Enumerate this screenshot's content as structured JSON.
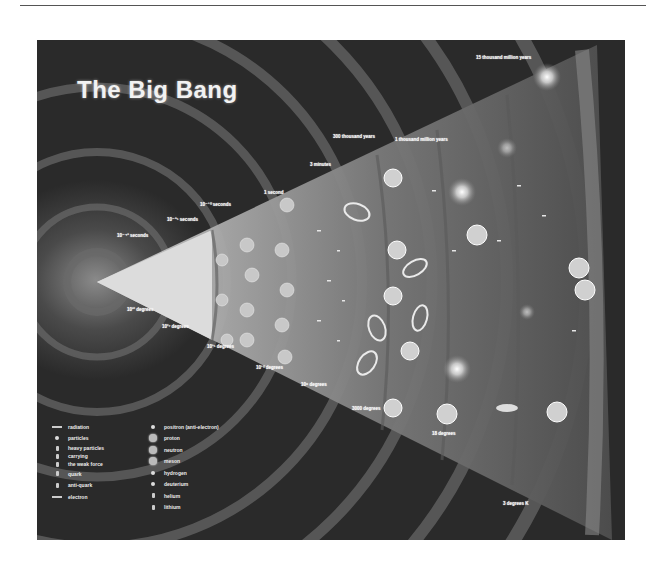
{
  "diagram": {
    "title": "The Big Bang",
    "time_labels": [
      {
        "text": "10⁻⁴³ seconds",
        "x": 80,
        "y": 193
      },
      {
        "text": "10⁻³⁵ seconds",
        "x": 130,
        "y": 177
      },
      {
        "text": "10⁻¹⁰ seconds",
        "x": 163,
        "y": 162
      },
      {
        "text": "1 second",
        "x": 227,
        "y": 150
      },
      {
        "text": "3 minutes",
        "x": 273,
        "y": 122
      },
      {
        "text": "300 thousand years",
        "x": 296,
        "y": 94
      },
      {
        "text": "1 thousand million years",
        "x": 358,
        "y": 97
      },
      {
        "text": "15 thousand million years",
        "x": 439,
        "y": 15
      }
    ],
    "temperature_labels": [
      {
        "text": "10³² degrees",
        "x": 90,
        "y": 267
      },
      {
        "text": "10²⁷ degrees",
        "x": 125,
        "y": 284
      },
      {
        "text": "10¹⁵ degrees",
        "x": 170,
        "y": 304
      },
      {
        "text": "10¹⁰ degrees",
        "x": 219,
        "y": 325
      },
      {
        "text": "10⁹ degrees",
        "x": 264,
        "y": 342
      },
      {
        "text": "3000 degrees",
        "x": 315,
        "y": 366
      },
      {
        "text": "18 degrees",
        "x": 395,
        "y": 391
      },
      {
        "text": "3 degrees K",
        "x": 466,
        "y": 461
      }
    ],
    "legend": {
      "left": [
        {
          "symbol": "line",
          "label": "radiation"
        },
        {
          "symbol": "dot",
          "label": "particles"
        },
        {
          "symbol": "small",
          "label": "heavy particles"
        },
        {
          "symbol": "small",
          "label": "carrying"
        },
        {
          "symbol": "small",
          "label": "the weak force"
        },
        {
          "symbol": "small",
          "label": "quark"
        },
        {
          "symbol": "small",
          "label": "anti-quark"
        },
        {
          "symbol": "line",
          "label": "electron"
        }
      ],
      "right": [
        {
          "symbol": "dot",
          "label": "positron (anti-electron)"
        },
        {
          "symbol": "ball",
          "label": "proton"
        },
        {
          "symbol": "ball",
          "label": "neutron"
        },
        {
          "symbol": "ball",
          "label": "meson"
        },
        {
          "symbol": "dot",
          "label": "hydrogen"
        },
        {
          "symbol": "dot",
          "label": "deuterium"
        },
        {
          "symbol": "small",
          "label": "helium"
        },
        {
          "symbol": "small",
          "label": "lithium"
        }
      ]
    }
  }
}
